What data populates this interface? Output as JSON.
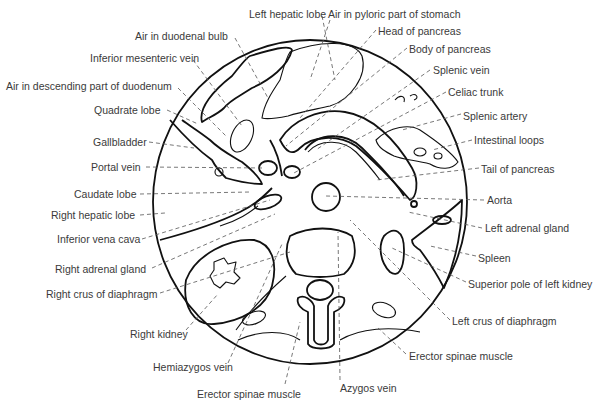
{
  "figure": {
    "type": "anatomical cross-section diagram",
    "labels_left": [
      {
        "text": "Left hepatic lobe",
        "x": 249,
        "y": 8
      },
      {
        "text": "Air in duodenal bulb",
        "x": 135,
        "y": 30
      },
      {
        "text": "Inferior mesenteric vein",
        "x": 90,
        "y": 52
      },
      {
        "text": "Air in descending part of duodenum",
        "x": 6,
        "y": 80
      },
      {
        "text": "Quadrate lobe",
        "x": 94,
        "y": 104
      },
      {
        "text": "Gallbladder",
        "x": 93,
        "y": 136
      },
      {
        "text": "Portal vein",
        "x": 91,
        "y": 161
      },
      {
        "text": "Caudate lobe",
        "x": 74,
        "y": 188
      },
      {
        "text": "Right hepatic lobe",
        "x": 51,
        "y": 209
      },
      {
        "text": "Inferior vena cava",
        "x": 57,
        "y": 233
      },
      {
        "text": "Right adrenal gland",
        "x": 55,
        "y": 263
      },
      {
        "text": "Right crus of diaphragm",
        "x": 46,
        "y": 288
      },
      {
        "text": "Right kidney",
        "x": 130,
        "y": 328
      },
      {
        "text": "Hemiazygos vein",
        "x": 153,
        "y": 361
      },
      {
        "text": "Erector spinae muscle",
        "x": 197,
        "y": 388
      }
    ],
    "labels_right": [
      {
        "text": "Air in pyloric part of stomach",
        "x": 328,
        "y": 8
      },
      {
        "text": "Head of pancreas",
        "x": 378,
        "y": 25
      },
      {
        "text": "Body of pancreas",
        "x": 409,
        "y": 43
      },
      {
        "text": "Splenic vein",
        "x": 433,
        "y": 64
      },
      {
        "text": "Celiac trunk",
        "x": 448,
        "y": 86
      },
      {
        "text": "Splenic artery",
        "x": 463,
        "y": 110
      },
      {
        "text": "Intestinal loops",
        "x": 474,
        "y": 134
      },
      {
        "text": "Tail of pancreas",
        "x": 481,
        "y": 163
      },
      {
        "text": "Aorta",
        "x": 487,
        "y": 194
      },
      {
        "text": "Left adrenal gland",
        "x": 485,
        "y": 222
      },
      {
        "text": "Spleen",
        "x": 478,
        "y": 252
      },
      {
        "text": "Superior pole of left kidney",
        "x": 468,
        "y": 278
      },
      {
        "text": "Left crus of diaphragm",
        "x": 452,
        "y": 315
      },
      {
        "text": "Erector spinae muscle",
        "x": 409,
        "y": 350
      },
      {
        "text": "Azygos vein",
        "x": 340,
        "y": 382
      }
    ]
  }
}
